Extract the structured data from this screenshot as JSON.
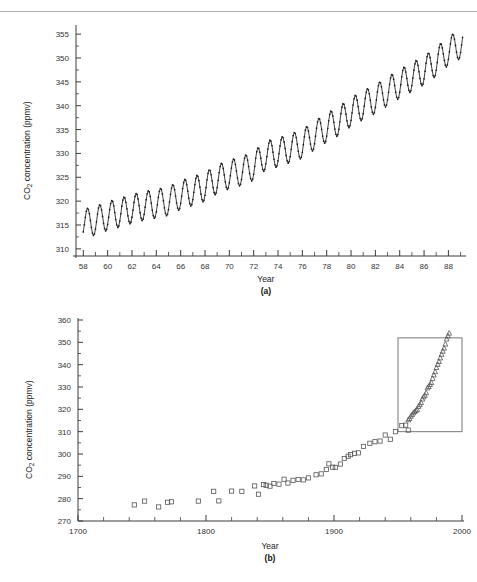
{
  "header": {
    "fragment": ""
  },
  "panels": [
    {
      "id": "a",
      "caption": "(a)",
      "xlabel": "Year",
      "ylabel_prefix": "CO",
      "ylabel_sub": "2",
      "ylabel_suffix": " concentration (ppmv)",
      "ytick_labels": [
        "310",
        "315",
        "320",
        "325",
        "330",
        "335",
        "340",
        "345",
        "350",
        "355"
      ],
      "xtick_labels": [
        "58",
        "60",
        "62",
        "64",
        "66",
        "68",
        "70",
        "72",
        "74",
        "76",
        "78",
        "80",
        "82",
        "84",
        "86",
        "88"
      ]
    },
    {
      "id": "b",
      "caption": "(b)",
      "xlabel": "Year",
      "ylabel_prefix": "CO",
      "ylabel_sub": "2",
      "ylabel_suffix": " concentration (ppmv)",
      "ytick_labels": [
        "270",
        "280",
        "290",
        "300",
        "310",
        "320",
        "330",
        "340",
        "350",
        "360"
      ],
      "xtick_labels": [
        "1700",
        "1800",
        "1900",
        "2000"
      ]
    }
  ],
  "colors": {
    "axis": "#3a3a3a",
    "curve": "#1d1d1d",
    "marker": "#555555",
    "inset_box": "#777777",
    "rule": "#b0b0b0"
  },
  "chart_data": [
    {
      "type": "line",
      "panel": "a",
      "title": "",
      "xlabel": "Year",
      "ylabel": "CO2 concentration (ppmv)",
      "xlim": [
        57.4,
        89.2
      ],
      "ylim": [
        308.5,
        356.5
      ],
      "xticks": [
        58,
        60,
        62,
        64,
        66,
        68,
        70,
        72,
        74,
        76,
        78,
        80,
        82,
        84,
        86,
        88
      ],
      "xtick_labels": [
        "58",
        "60",
        "62",
        "64",
        "66",
        "68",
        "70",
        "72",
        "74",
        "76",
        "78",
        "80",
        "82",
        "84",
        "86",
        "88"
      ],
      "yticks": [
        310,
        315,
        320,
        325,
        330,
        335,
        340,
        345,
        350,
        355
      ],
      "minor_xtick_step": 1,
      "grid": false,
      "legend": "none",
      "description": "Mauna Loa monthly mean CO2 with seasonal cycle, 1958-1989",
      "series": [
        {
          "name": "Mauna Loa monthly CO2",
          "marker": "dot",
          "annual_mean": {
            "x": [
              58,
              59,
              60,
              61,
              62,
              63,
              64,
              65,
              66,
              67,
              68,
              69,
              70,
              71,
              72,
              73,
              74,
              75,
              76,
              77,
              78,
              79,
              80,
              81,
              82,
              83,
              84,
              85,
              86,
              87,
              88,
              89
            ],
            "y": [
              315.3,
              315.9,
              316.9,
              317.6,
              318.4,
              319.0,
              319.5,
              320.0,
              321.3,
              322.1,
              323.0,
              324.6,
              325.6,
              326.3,
              327.4,
              329.6,
              330.2,
              331.1,
              332.0,
              333.8,
              335.4,
              336.8,
              338.7,
              340.1,
              341.4,
              343.0,
              344.6,
              346.0,
              347.4,
              349.2,
              351.5,
              352.9
            ]
          },
          "seasonal_amplitude_ppmv": 6.0,
          "seasonal_peak_month": 5,
          "seasonal_trough_month": 10,
          "points_per_year": 12
        }
      ]
    },
    {
      "type": "scatter",
      "panel": "b",
      "title": "",
      "xlabel": "Year",
      "ylabel": "CO2 concentration (ppmv)",
      "xlim": [
        1700,
        2000
      ],
      "ylim": [
        270,
        360
      ],
      "xticks": [
        1700,
        1800,
        1900,
        2000
      ],
      "xtick_labels": [
        "1700",
        "1800",
        "1900",
        "2000"
      ],
      "yticks": [
        270,
        280,
        290,
        300,
        310,
        320,
        330,
        340,
        350,
        360
      ],
      "minor_xtick_step": 20,
      "minor_ytick_step": 5,
      "grid": false,
      "legend": "none",
      "inset_box": {
        "x0": 1950,
        "x1": 2000,
        "y0": 310,
        "y1": 352
      },
      "description": "Ice-core CO2 record (open squares) 1740-1960 plus Mauna Loa record (open triangles) 1958-1990; box highlights the Mauna Loa interval shown in panel (a)",
      "series": [
        {
          "name": "Ice core (Siple station)",
          "marker": "square",
          "x": [
            1744,
            1752,
            1763,
            1770,
            1773,
            1794,
            1806,
            1810,
            1820,
            1828,
            1838,
            1841,
            1845,
            1847,
            1850,
            1853,
            1857,
            1861,
            1864,
            1868,
            1872,
            1876,
            1880,
            1886,
            1890,
            1894,
            1896,
            1899,
            1901,
            1905,
            1908,
            1911,
            1913,
            1916,
            1919,
            1923,
            1928,
            1932,
            1936,
            1940,
            1944,
            1948,
            1953,
            1956,
            1958
          ],
          "y": [
            277.2,
            278.9,
            276.3,
            278.4,
            278.6,
            278.9,
            283.3,
            279.0,
            283.4,
            283.3,
            285.7,
            282.0,
            286.3,
            286.0,
            285.6,
            286.8,
            286.5,
            288.7,
            287.0,
            288.2,
            288.6,
            288.4,
            289.3,
            290.7,
            291.1,
            293.1,
            295.6,
            294.1,
            294.0,
            295.5,
            298.0,
            299.0,
            299.7,
            300.3,
            300.5,
            303.4,
            304.8,
            305.5,
            305.8,
            308.5,
            306.6,
            310.0,
            312.7,
            312.9,
            310.7
          ]
        },
        {
          "name": "Mauna Loa annual mean",
          "marker": "triangle",
          "x": [
            1958,
            1959,
            1960,
            1961,
            1962,
            1963,
            1964,
            1965,
            1966,
            1967,
            1968,
            1969,
            1970,
            1971,
            1972,
            1973,
            1974,
            1975,
            1976,
            1977,
            1978,
            1979,
            1980,
            1981,
            1982,
            1983,
            1984,
            1985,
            1986,
            1987,
            1988,
            1989,
            1990
          ],
          "y": [
            315.3,
            315.9,
            316.9,
            317.6,
            318.4,
            319.0,
            319.5,
            320.0,
            321.3,
            322.1,
            323.0,
            324.6,
            325.6,
            326.3,
            327.4,
            329.6,
            330.2,
            331.1,
            332.0,
            333.8,
            335.4,
            336.8,
            338.7,
            340.1,
            341.4,
            343.0,
            344.6,
            346.0,
            347.4,
            349.2,
            351.5,
            352.9,
            354.1
          ]
        }
      ]
    }
  ]
}
